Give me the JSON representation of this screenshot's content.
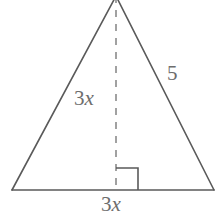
{
  "figure": {
    "kind": "isosceles-triangle-with-altitude",
    "background_color": "#ffffff",
    "stroke_color": "#5a5a5a",
    "label_color": "#6d6d6d",
    "labels": {
      "altitude": {
        "coefficient": "3",
        "variable": "x",
        "full": "3x"
      },
      "base": {
        "coefficient": "3",
        "variable": "x",
        "full": "3x"
      },
      "side": {
        "value": "5"
      }
    },
    "geometry": {
      "apex": [
        116,
        -4
      ],
      "bottom_left": [
        12,
        190
      ],
      "bottom_right": [
        214,
        190
      ],
      "foot_of_altitude": [
        116,
        190
      ],
      "altitude_dash_pattern": "7 7",
      "right_angle_marker_size": 22,
      "right_angle_marker_corner": [
        116,
        190
      ],
      "right_angle_marker_opens": "right"
    }
  }
}
